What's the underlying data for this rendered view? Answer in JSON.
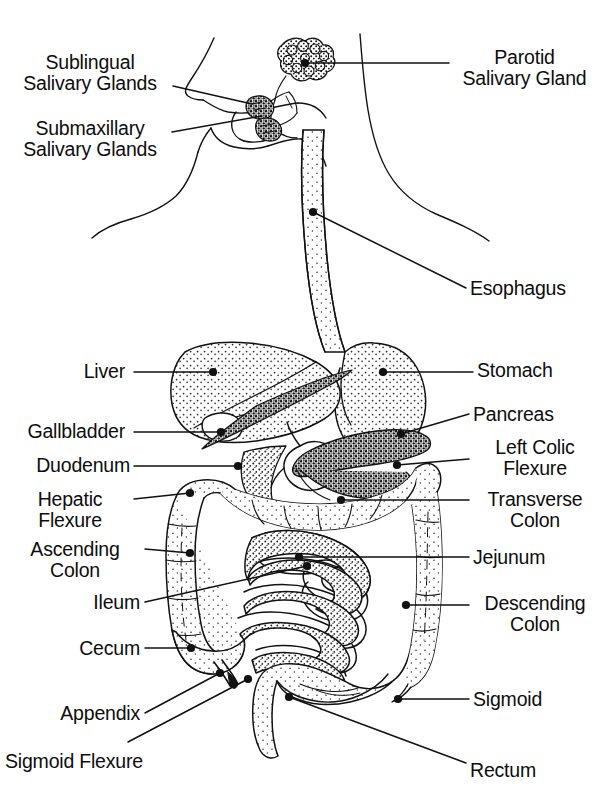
{
  "diagram": {
    "style": {
      "ink": "#111111",
      "paper": "#ffffff",
      "stipple": "#2b2b2b",
      "line_width": 1.4
    }
  },
  "labels_left": [
    {
      "id": "sublingual-salivary-glands",
      "text": "Sublingual\nSalivary Glands",
      "x": 8,
      "y": 52,
      "w": 164,
      "align": "center"
    },
    {
      "id": "submaxillary-salivary-glands",
      "text": "Submaxillary\nSalivary Glands",
      "x": 8,
      "y": 118,
      "w": 164,
      "align": "center"
    },
    {
      "id": "liver",
      "text": "Liver",
      "x": 10,
      "y": 361,
      "w": 115,
      "align": "right"
    },
    {
      "id": "gallbladder",
      "text": "Gallbladder",
      "x": 10,
      "y": 421,
      "w": 115,
      "align": "right"
    },
    {
      "id": "duodenum",
      "text": "Duodenum",
      "x": 10,
      "y": 455,
      "w": 120,
      "align": "right"
    },
    {
      "id": "hepatic-flexure",
      "text": "Hepatic\nFlexure",
      "x": 10,
      "y": 489,
      "w": 120,
      "align": "center"
    },
    {
      "id": "ascending-colon",
      "text": "Ascending\nColon",
      "x": 10,
      "y": 539,
      "w": 130,
      "align": "center"
    },
    {
      "id": "ileum",
      "text": "Ileum",
      "x": 10,
      "y": 592,
      "w": 130,
      "align": "right"
    },
    {
      "id": "cecum",
      "text": "Cecum",
      "x": 10,
      "y": 638,
      "w": 130,
      "align": "right"
    },
    {
      "id": "appendix",
      "text": "Appendix",
      "x": 10,
      "y": 703,
      "w": 130,
      "align": "right"
    },
    {
      "id": "sigmoid-flexure",
      "text": "Sigmoid Flexure",
      "x": 5,
      "y": 751,
      "w": 200,
      "align": "left"
    }
  ],
  "labels_right": [
    {
      "id": "parotid-salivary-gland",
      "text": "Parotid\nSalivary Gland",
      "x": 452,
      "y": 47,
      "w": 145,
      "align": "center"
    },
    {
      "id": "esophagus",
      "text": "Esophagus",
      "x": 470,
      "y": 278,
      "w": 130,
      "align": "left"
    },
    {
      "id": "stomach",
      "text": "Stomach",
      "x": 477,
      "y": 360,
      "w": 120,
      "align": "left"
    },
    {
      "id": "pancreas",
      "text": "Pancreas",
      "x": 473,
      "y": 404,
      "w": 120,
      "align": "left"
    },
    {
      "id": "left-colic-flexure",
      "text": "Left Colic\nFlexure",
      "x": 473,
      "y": 437,
      "w": 124,
      "align": "center"
    },
    {
      "id": "transverse-colon",
      "text": "Transverse\nColon",
      "x": 473,
      "y": 489,
      "w": 124,
      "align": "center"
    },
    {
      "id": "jejunum",
      "text": "Jejunum",
      "x": 473,
      "y": 547,
      "w": 120,
      "align": "left"
    },
    {
      "id": "descending-colon",
      "text": "Descending\nColon",
      "x": 473,
      "y": 593,
      "w": 124,
      "align": "center"
    },
    {
      "id": "sigmoid",
      "text": "Sigmoid",
      "x": 473,
      "y": 689,
      "w": 120,
      "align": "left"
    },
    {
      "id": "rectum",
      "text": "Rectum",
      "x": 470,
      "y": 760,
      "w": 120,
      "align": "left"
    }
  ],
  "leaders": [
    {
      "id": "leader-sublingual",
      "points": "173,86 252,104"
    },
    {
      "id": "leader-submaxillary",
      "points": "172,132 262,116"
    },
    {
      "id": "leader-parotid",
      "points": "449,63 305,63"
    },
    {
      "id": "leader-esophagus",
      "points": "466,288 313,212"
    },
    {
      "id": "leader-stomach",
      "points": "473,372 383,372"
    },
    {
      "id": "leader-pancreas",
      "points": "469,414 401,434"
    },
    {
      "id": "leader-left-colic",
      "points": "469,459 397,465"
    },
    {
      "id": "leader-transverse",
      "points": "469,500 341,500"
    },
    {
      "id": "leader-jejunum",
      "points": "469,557 299,557"
    },
    {
      "id": "leader-descending",
      "points": "469,605 406,605"
    },
    {
      "id": "leader-sigmoid",
      "points": "469,699 398,699"
    },
    {
      "id": "leader-rectum",
      "points": "466,763 289,697"
    },
    {
      "id": "leader-liver",
      "points": "134,372 213,372"
    },
    {
      "id": "leader-gallbladder",
      "points": "134,432 221,432"
    },
    {
      "id": "leader-duodenum",
      "points": "134,466 238,466"
    },
    {
      "id": "leader-hepatic",
      "points": "134,499 190,493"
    },
    {
      "id": "leader-ascending",
      "points": "145,549 190,553"
    },
    {
      "id": "leader-ileum",
      "points": "145,602 307,566"
    },
    {
      "id": "leader-cecum",
      "points": "145,648 191,648"
    },
    {
      "id": "leader-appendix",
      "points": "145,713 220,673"
    },
    {
      "id": "leader-sigmoid-flexure",
      "points": "128,742 248,679"
    }
  ],
  "anchor_dots": [
    {
      "id": "dot-parotid",
      "x": 305,
      "y": 63
    },
    {
      "id": "dot-esophagus",
      "x": 313,
      "y": 212
    },
    {
      "id": "dot-liver",
      "x": 213,
      "y": 372
    },
    {
      "id": "dot-stomach",
      "x": 383,
      "y": 372
    },
    {
      "id": "dot-gallbladder",
      "x": 221,
      "y": 432
    },
    {
      "id": "dot-pancreas",
      "x": 401,
      "y": 434
    },
    {
      "id": "dot-duodenum",
      "x": 238,
      "y": 466
    },
    {
      "id": "dot-left-colic",
      "x": 397,
      "y": 465
    },
    {
      "id": "dot-hepatic",
      "x": 190,
      "y": 493
    },
    {
      "id": "dot-transverse",
      "x": 341,
      "y": 500
    },
    {
      "id": "dot-ascending",
      "x": 190,
      "y": 553
    },
    {
      "id": "dot-jejunum",
      "x": 299,
      "y": 557
    },
    {
      "id": "dot-ileum",
      "x": 307,
      "y": 566
    },
    {
      "id": "dot-descending",
      "x": 406,
      "y": 605
    },
    {
      "id": "dot-cecum",
      "x": 191,
      "y": 648
    },
    {
      "id": "dot-appendix",
      "x": 220,
      "y": 673
    },
    {
      "id": "dot-sigmoid-flexure",
      "x": 248,
      "y": 679
    },
    {
      "id": "dot-rectum",
      "x": 289,
      "y": 697
    },
    {
      "id": "dot-sigmoid",
      "x": 398,
      "y": 699
    }
  ]
}
